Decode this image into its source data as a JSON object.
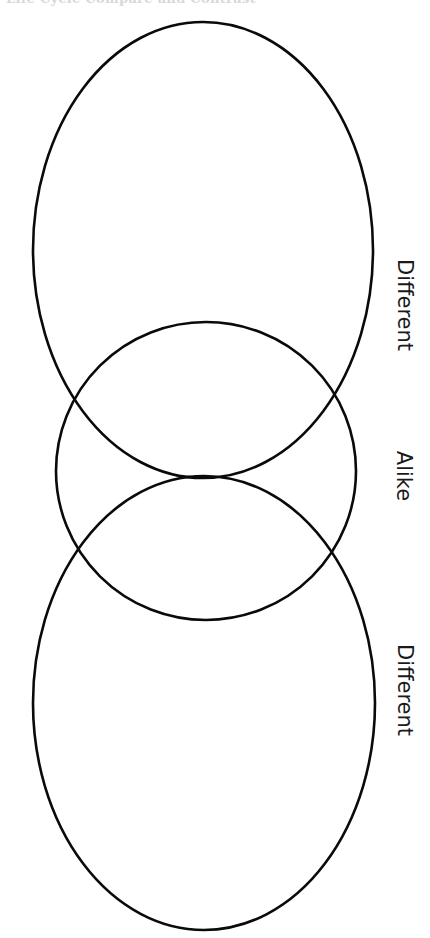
{
  "page": {
    "background_color": "#ffffff",
    "width": 430,
    "height": 938
  },
  "header": {
    "cut_off_text": "Life Cycle Compare and Contrast",
    "visible": "partially cropped at top edge",
    "color": "#b9b9c0"
  },
  "diagram": {
    "kind": "venn-diagram",
    "stroke_color": "#0a0a0a",
    "fill_color": "none",
    "stroke_width": 2.6,
    "orientation": "vertical-three-ellipse",
    "ellipses": [
      {
        "name": "top-ellipse",
        "region": "Different",
        "cx": 203,
        "cy": 250,
        "rx": 170,
        "ry": 228
      },
      {
        "name": "middle-ellipse",
        "region": "Alike",
        "cx": 206,
        "cy": 471,
        "rx": 150,
        "ry": 149
      },
      {
        "name": "bottom-ellipse",
        "region": "Different",
        "cx": 204,
        "cy": 703,
        "rx": 171,
        "ry": 227
      }
    ],
    "intersections": [
      {
        "name": "left-crossing",
        "x": 57,
        "y": 478
      },
      {
        "name": "right-crossing",
        "x": 357,
        "y": 479
      }
    ]
  },
  "labels": {
    "different_top": "Different",
    "alike": "Alike",
    "different_bottom": "Different",
    "rotation_degrees": 90,
    "color": "#1a1a1a"
  }
}
